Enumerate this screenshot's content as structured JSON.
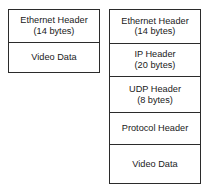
{
  "diagram": {
    "background_color": "#ffffff",
    "line_color": "#2b2b2b",
    "text_color": "#1a1a1a",
    "stacks": [
      {
        "id": "left-stack",
        "name": "raw-ethernet-packet",
        "fields": [
          {
            "name": "Ethernet Header",
            "size": "(14 bytes)"
          },
          {
            "name": "Video Data",
            "size": ""
          }
        ]
      },
      {
        "id": "right-stack",
        "name": "ip-udp-encapsulated-packet",
        "fields": [
          {
            "name": "Ethernet Header",
            "size": "(14 bytes)"
          },
          {
            "name": "IP Header",
            "size": "(20 bytes)"
          },
          {
            "name": "UDP Header",
            "size": "(8 bytes)"
          },
          {
            "name": "Protocol Header",
            "size": ""
          },
          {
            "name": "Video Data",
            "size": ""
          }
        ]
      }
    ]
  }
}
